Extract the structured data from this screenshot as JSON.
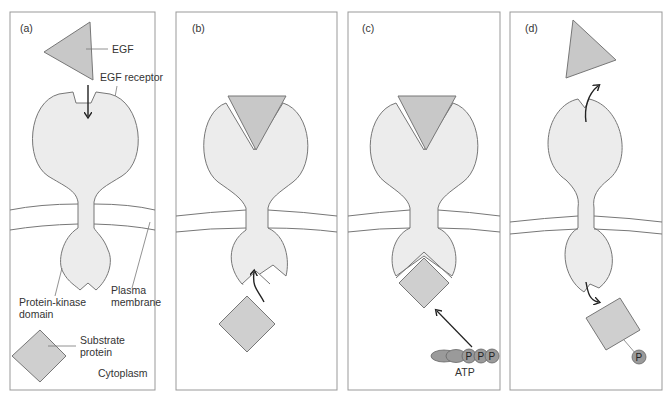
{
  "figure": {
    "colors": {
      "receptor_fill": "#ececec",
      "ligand_fill": "#c8c8c8",
      "substrate_fill": "#cfcfcf",
      "phosphate_fill": "#9a9a9a",
      "outline": "#777777",
      "panel_border": "#999999",
      "arrow": "#222222"
    },
    "panels": [
      {
        "id": "a",
        "label": "(a)"
      },
      {
        "id": "b",
        "label": "(b)"
      },
      {
        "id": "c",
        "label": "(c)"
      },
      {
        "id": "d",
        "label": "(d)"
      }
    ],
    "labels": {
      "egf": "EGF",
      "egf_receptor": "EGF receptor",
      "protein_kinase_line1": "Protein-kinase",
      "protein_kinase_line2": "domain",
      "plasma_line1": "Plasma",
      "plasma_line2": "membrane",
      "substrate_line1": "Substrate",
      "substrate_line2": "protein",
      "cytoplasm": "Cytoplasm",
      "atp": "ATP",
      "phosphate": "P"
    }
  }
}
